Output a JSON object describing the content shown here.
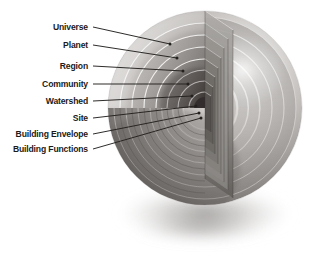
{
  "figure": {
    "background_color": "#ffffff",
    "label_color": "#1b1b1b",
    "leader_line_color": "#23211f"
  },
  "chart_data": {
    "type": "diagram",
    "subtype": "nested-concentric-sphere-cutaway",
    "ordering": "outermost-to-innermost",
    "shell_count": 8,
    "categories": [
      "Universe",
      "Planet",
      "Region",
      "Community",
      "Watershed",
      "Site",
      "Building Envelope",
      "Building Functions"
    ],
    "shells": [
      {
        "rank": 1,
        "label": "Universe",
        "radius": 97,
        "fill": "#d6d4d2"
      },
      {
        "rank": 2,
        "label": "Planet",
        "radius": 85,
        "fill": "#c2bfbd"
      },
      {
        "rank": 3,
        "label": "Region",
        "radius": 73,
        "fill": "#aeaaa7"
      },
      {
        "rank": 4,
        "label": "Community",
        "radius": 61,
        "fill": "#999592"
      },
      {
        "rank": 5,
        "label": "Watershed",
        "radius": 49,
        "fill": "#85817e"
      },
      {
        "rank": 6,
        "label": "Site",
        "radius": 38,
        "fill": "#706c69"
      },
      {
        "rank": 7,
        "label": "Building Envelope",
        "radius": 27,
        "fill": "#5b5755"
      },
      {
        "rank": 8,
        "label": "Building Functions",
        "radius": 16,
        "fill": "#47433f"
      }
    ],
    "legend": null,
    "axes": null,
    "grid": false
  },
  "labels": [
    {
      "id": "universe",
      "text": "Universe",
      "x": 88,
      "y": 27,
      "dot_x": 170,
      "dot_y": 44
    },
    {
      "id": "planet",
      "text": "Planet",
      "x": 88,
      "y": 45,
      "dot_x": 177,
      "dot_y": 58
    },
    {
      "id": "region",
      "text": "Region",
      "x": 88,
      "y": 66,
      "dot_x": 183,
      "dot_y": 71
    },
    {
      "id": "community",
      "text": "Community",
      "x": 88,
      "y": 84,
      "dot_x": 188,
      "dot_y": 84
    },
    {
      "id": "watershed",
      "text": "Watershed",
      "x": 88,
      "y": 101,
      "dot_x": 192,
      "dot_y": 96
    },
    {
      "id": "site",
      "text": "Site",
      "x": 88,
      "y": 118,
      "dot_x": 196,
      "dot_y": 106
    },
    {
      "id": "building-envelope",
      "text": "Building Envelope",
      "x": 88,
      "y": 134,
      "dot_x": 199,
      "dot_y": 113
    },
    {
      "id": "building-functions",
      "text": "Building Functions",
      "x": 88,
      "y": 149,
      "dot_x": 201,
      "dot_y": 118
    }
  ],
  "sphere": {
    "center_x": 205,
    "center_y": 108,
    "radius": 97,
    "cut_angle_start_deg": 90,
    "cut_angle_end_deg": 180,
    "highlight_x": 243,
    "highlight_y": 70,
    "shadow_center_x": 205,
    "shadow_center_y": 216,
    "shadow_rx": 95,
    "shadow_ry": 30
  }
}
